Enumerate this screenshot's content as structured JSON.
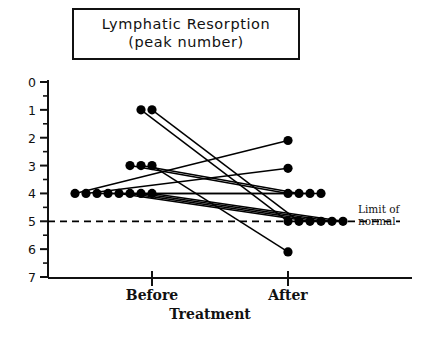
{
  "title": {
    "line1": "Lymphatic Resorption",
    "line2": "(peak number)"
  },
  "annotation": {
    "limit_line1": "Limit of",
    "limit_line2": "normal"
  },
  "axis": {
    "x_label_before": "Before",
    "x_label_after": "After",
    "x_label_main": "Treatment",
    "y_ticks": [
      "7",
      "6",
      "5",
      "4",
      "3",
      "2",
      "1",
      "0"
    ]
  },
  "chart_data": {
    "type": "line",
    "title": "Lymphatic Resorption (peak number)",
    "subtitle": "(peak number)",
    "xlabel": "Treatment",
    "ylabel": "",
    "categories": [
      "Before",
      "After"
    ],
    "ylim": [
      0,
      7
    ],
    "yticks": [
      0,
      1,
      2,
      3,
      4,
      5,
      6,
      7
    ],
    "minor_tick_step": 0.5,
    "grid": false,
    "legend": null,
    "reference_line": {
      "value": 2,
      "style": "dashed",
      "label": "Limit of normal"
    },
    "marker": "filled-circle",
    "n_subjects": 13,
    "series": [
      {
        "name": "Subject 1",
        "values": [
          6,
          2
        ]
      },
      {
        "name": "Subject 2",
        "values": [
          6,
          2
        ]
      },
      {
        "name": "Subject 3",
        "values": [
          4,
          3
        ]
      },
      {
        "name": "Subject 4",
        "values": [
          4,
          3
        ]
      },
      {
        "name": "Subject 5",
        "values": [
          4,
          0.9
        ]
      },
      {
        "name": "Subject 6",
        "values": [
          3,
          4.9
        ]
      },
      {
        "name": "Subject 7",
        "values": [
          3,
          3.9
        ]
      },
      {
        "name": "Subject 8",
        "values": [
          3,
          3
        ]
      },
      {
        "name": "Subject 9",
        "values": [
          3,
          3
        ]
      },
      {
        "name": "Subject 10",
        "values": [
          3,
          2
        ]
      },
      {
        "name": "Subject 11",
        "values": [
          3,
          2
        ]
      },
      {
        "name": "Subject 12",
        "values": [
          3,
          2
        ]
      },
      {
        "name": "Subject 13",
        "values": [
          3,
          2
        ]
      }
    ],
    "before_counts": {
      "6": 2,
      "4": 3,
      "3": 8
    },
    "after_counts": {
      "4.9": 1,
      "3.9": 1,
      "3": 4,
      "2": 4,
      "0.9": 1
    }
  },
  "colors": {
    "ink": "#111111",
    "background": "#ffffff",
    "marker": "#000000",
    "reference_line": "#000000"
  }
}
